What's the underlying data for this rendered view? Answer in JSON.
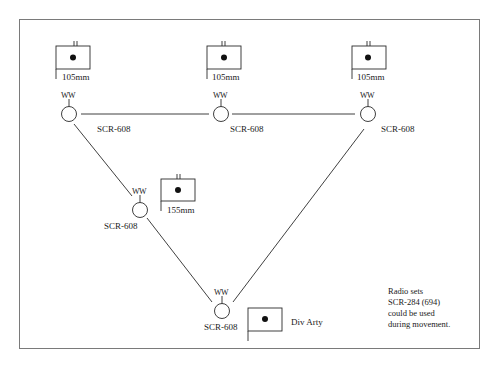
{
  "diagram": {
    "type": "radio-net",
    "stroke_color": "#2a2a2a",
    "frame_color": "#7a7a7a",
    "nodes": [
      {
        "id": "n1",
        "antenna_label": "WW",
        "radio": "SCR-608",
        "unit": "105mm"
      },
      {
        "id": "n2",
        "antenna_label": "WW",
        "radio": "SCR-608",
        "unit": "105mm"
      },
      {
        "id": "n3",
        "antenna_label": "WW",
        "radio": "SCR-608",
        "unit": "105mm"
      },
      {
        "id": "n4",
        "antenna_label": "WW",
        "radio": "SCR-608",
        "unit": "155mm"
      },
      {
        "id": "n5",
        "antenna_label": "WW",
        "radio": "SCR-608",
        "unit": "Div Arty"
      }
    ],
    "links": [
      {
        "from": "n1",
        "to": "n2"
      },
      {
        "from": "n2",
        "to": "n3"
      },
      {
        "from": "n1",
        "to": "n4"
      },
      {
        "from": "n4",
        "to": "n5"
      },
      {
        "from": "n5",
        "to": "n3"
      }
    ],
    "note": {
      "lines": [
        "Radio sets",
        "SCR-284 (694)",
        "could be used",
        "during movement."
      ]
    }
  }
}
